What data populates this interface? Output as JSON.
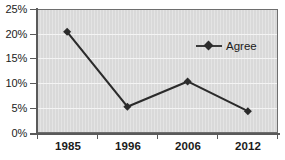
{
  "chart_data": {
    "type": "line",
    "title": "",
    "subtitle": "",
    "xlabel": "",
    "ylabel": "",
    "categories": [
      "1985",
      "1996",
      "2006",
      "2012"
    ],
    "series": [
      {
        "name": "Agree",
        "values": [
          20.4,
          5.3,
          10.4,
          4.4
        ],
        "marker": "diamond",
        "color": "#2b2b2b"
      }
    ],
    "ylim": [
      0,
      25
    ],
    "yticks": [
      0,
      5,
      10,
      15,
      20,
      25
    ],
    "ytick_labels": [
      "0%",
      "5%",
      "10%",
      "15%",
      "20%",
      "25%"
    ],
    "grid": true,
    "grid_axis": "y",
    "legend": {
      "position": "inside-top-right",
      "entries": [
        "Agree"
      ]
    },
    "plot_background": "#d9d9d9",
    "gridline_color": "#f4f4f4",
    "axis_color": "#5a5a5a",
    "figure_background": "#ffffff"
  },
  "legend": {
    "agree_label": "Agree"
  },
  "axes": {
    "y_labels": [
      "25%",
      "20%",
      "15%",
      "10%",
      "5%",
      "0%"
    ],
    "x_labels": [
      "1985",
      "1996",
      "2006",
      "2012"
    ]
  }
}
